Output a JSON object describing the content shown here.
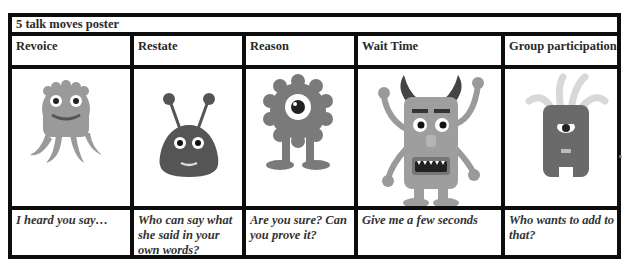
{
  "poster": {
    "title": "5 talk moves poster",
    "columns": [
      {
        "heading": "Revoice",
        "phrase": "I heard you say…",
        "monster": "octopus-monster-icon"
      },
      {
        "heading": "Restate",
        "phrase": "Who can say what she said in your own words?",
        "monster": "antenna-blob-monster-icon"
      },
      {
        "heading": "Reason",
        "phrase": "Are you sure? Can you prove it?",
        "monster": "cyclops-gear-monster-icon"
      },
      {
        "heading": "Wait Time",
        "phrase": "Give me a few seconds",
        "monster": "horned-monster-icon"
      },
      {
        "heading": "Group participation",
        "phrase": "Who wants to add to that?",
        "monster": "tentacle-head-monster-icon"
      }
    ]
  }
}
